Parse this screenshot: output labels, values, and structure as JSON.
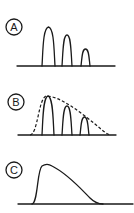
{
  "panels": [
    {
      "label": "A",
      "description": "three discrete peaks of decreasing height"
    },
    {
      "label": "B",
      "description": "three discrete peaks with dashed envelope curve"
    },
    {
      "label": "C",
      "description": "single continuous skewed curve"
    }
  ],
  "colors": {
    "line": "#1a1a1a",
    "background": "#ffffff"
  }
}
